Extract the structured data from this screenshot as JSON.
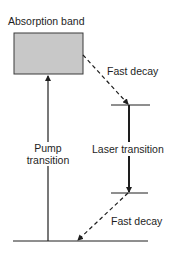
{
  "diagram": {
    "colors": {
      "band_fill": "#c8c8c8",
      "band_stroke": "#3a3a3a",
      "line": "#1e1e1e",
      "background": "#ffffff"
    },
    "labels": {
      "absorption_band": "Absorption band",
      "fast_decay_upper": "Fast decay",
      "pump_line1": "Pump",
      "pump_line2": "transition",
      "laser_transition": "Laser transition",
      "fast_decay_lower": "Fast decay"
    },
    "levels": [
      {
        "name": "absorption-band",
        "type": "band"
      },
      {
        "name": "upper-laser-level",
        "type": "line"
      },
      {
        "name": "lower-laser-level",
        "type": "line"
      },
      {
        "name": "ground-level",
        "type": "line"
      }
    ],
    "transitions": [
      {
        "name": "pump-transition",
        "from": "ground-level",
        "to": "absorption-band",
        "style": "solid"
      },
      {
        "name": "fast-decay-upper",
        "from": "absorption-band",
        "to": "upper-laser-level",
        "style": "dashed"
      },
      {
        "name": "laser-transition",
        "from": "upper-laser-level",
        "to": "lower-laser-level",
        "style": "solid-bold"
      },
      {
        "name": "fast-decay-lower",
        "from": "lower-laser-level",
        "to": "ground-level",
        "style": "dashed"
      }
    ]
  }
}
